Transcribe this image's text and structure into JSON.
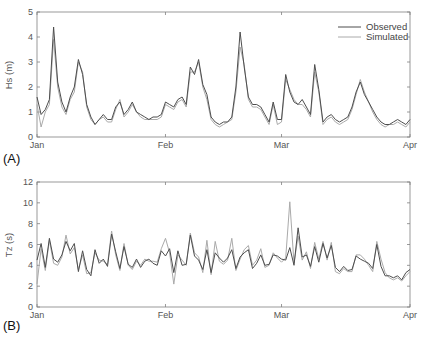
{
  "chart_data": [
    {
      "id": "A",
      "type": "line",
      "panel_label": "(A)",
      "title": "",
      "xlabel": "",
      "ylabel": "Hs (m)",
      "ylim": [
        0,
        5
      ],
      "yticks": [
        0,
        1,
        2,
        3,
        4,
        5
      ],
      "xticks": [
        "Jan",
        "Feb",
        "Mar",
        "Apr"
      ],
      "xtick_days": [
        0,
        31,
        59,
        90
      ],
      "xlim_days": [
        0,
        90
      ],
      "grid": false,
      "legend": {
        "position": "upper right",
        "entries": [
          "Observed",
          "Simulated"
        ]
      },
      "x_days": [
        0,
        1,
        2,
        3,
        4,
        5,
        6,
        7,
        8,
        9,
        10,
        11,
        12,
        13,
        14,
        15,
        16,
        17,
        18,
        19,
        20,
        21,
        22,
        23,
        24,
        25,
        26,
        27,
        28,
        29,
        30,
        31,
        32,
        33,
        34,
        35,
        36,
        37,
        38,
        39,
        40,
        41,
        42,
        43,
        44,
        45,
        46,
        47,
        48,
        49,
        50,
        51,
        52,
        53,
        54,
        55,
        56,
        57,
        58,
        59,
        60,
        61,
        62,
        63,
        64,
        65,
        66,
        67,
        68,
        69,
        70,
        71,
        72,
        73,
        74,
        75,
        76,
        77,
        78,
        79,
        80,
        81,
        82,
        83,
        84,
        85,
        86,
        87,
        88,
        89,
        90
      ],
      "series": [
        {
          "name": "Observed",
          "color": "#4d4d4d",
          "values": [
            1.6,
            0.9,
            1.1,
            1.5,
            4.4,
            2.2,
            1.4,
            1.0,
            1.6,
            2.0,
            3.1,
            2.5,
            1.3,
            0.8,
            0.5,
            0.7,
            0.9,
            0.7,
            0.7,
            1.2,
            1.4,
            0.9,
            1.1,
            1.4,
            1.0,
            0.9,
            0.8,
            0.7,
            0.8,
            0.8,
            0.9,
            1.4,
            1.3,
            1.2,
            1.5,
            1.6,
            1.3,
            2.8,
            2.5,
            3.1,
            2.1,
            1.7,
            0.8,
            0.6,
            0.5,
            0.6,
            0.6,
            0.8,
            2.0,
            4.2,
            2.8,
            1.6,
            1.3,
            1.3,
            1.2,
            0.9,
            0.6,
            1.4,
            0.7,
            0.7,
            2.5,
            1.8,
            1.4,
            1.3,
            1.5,
            1.2,
            0.9,
            2.9,
            1.9,
            0.6,
            0.8,
            0.9,
            0.7,
            0.6,
            0.7,
            0.8,
            1.2,
            1.8,
            2.2,
            1.7,
            1.4,
            1.1,
            0.8,
            0.6,
            0.5,
            0.5,
            0.6,
            0.7,
            0.6,
            0.5,
            0.7
          ]
        },
        {
          "name": "Simulated",
          "color": "#aaaaaa",
          "values": [
            1.3,
            0.4,
            1.0,
            1.3,
            3.9,
            2.0,
            1.2,
            0.9,
            1.5,
            1.8,
            3.0,
            2.6,
            1.2,
            0.7,
            0.5,
            0.7,
            0.8,
            0.6,
            0.6,
            1.1,
            1.5,
            0.8,
            1.0,
            1.3,
            1.0,
            0.8,
            0.7,
            0.7,
            0.7,
            0.7,
            0.8,
            1.3,
            1.2,
            1.1,
            1.4,
            1.5,
            1.2,
            2.6,
            2.6,
            3.0,
            2.0,
            1.5,
            0.7,
            0.5,
            0.4,
            0.5,
            0.6,
            0.7,
            1.8,
            3.6,
            2.9,
            1.5,
            1.2,
            1.2,
            1.1,
            0.8,
            0.5,
            1.3,
            0.5,
            0.6,
            2.3,
            1.9,
            1.5,
            1.3,
            1.3,
            1.1,
            0.8,
            2.6,
            1.8,
            0.5,
            0.7,
            0.8,
            0.6,
            0.5,
            0.6,
            0.7,
            1.1,
            1.7,
            2.3,
            1.8,
            1.4,
            1.0,
            0.7,
            0.5,
            0.4,
            0.5,
            0.5,
            0.6,
            0.5,
            0.4,
            0.6
          ]
        }
      ]
    },
    {
      "id": "B",
      "type": "line",
      "panel_label": "(B)",
      "title": "",
      "xlabel": "",
      "ylabel": "Tz (s)",
      "ylim": [
        0,
        12
      ],
      "yticks": [
        0,
        2,
        4,
        6,
        8,
        10,
        12
      ],
      "xticks": [
        "Jan",
        "Feb",
        "Mar",
        "Apr"
      ],
      "xtick_days": [
        0,
        31,
        59,
        90
      ],
      "xlim_days": [
        0,
        90
      ],
      "grid": false,
      "legend": null,
      "x_days": [
        0,
        1,
        2,
        3,
        4,
        5,
        6,
        7,
        8,
        9,
        10,
        11,
        12,
        13,
        14,
        15,
        16,
        17,
        18,
        19,
        20,
        21,
        22,
        23,
        24,
        25,
        26,
        27,
        28,
        29,
        30,
        31,
        32,
        33,
        34,
        35,
        36,
        37,
        38,
        39,
        40,
        41,
        42,
        43,
        44,
        45,
        46,
        47,
        48,
        49,
        50,
        51,
        52,
        53,
        54,
        55,
        56,
        57,
        58,
        59,
        60,
        61,
        62,
        63,
        64,
        65,
        66,
        67,
        68,
        69,
        70,
        71,
        72,
        73,
        74,
        75,
        76,
        77,
        78,
        79,
        80,
        81,
        82,
        83,
        84,
        85,
        86,
        87,
        88,
        89,
        90
      ],
      "series": [
        {
          "name": "Observed",
          "color": "#4d4d4d",
          "values": [
            4.5,
            6.1,
            3.8,
            6.6,
            4.6,
            4.3,
            5.0,
            6.3,
            5.4,
            6.1,
            3.4,
            5.4,
            3.6,
            3.0,
            5.5,
            4.2,
            4.6,
            3.9,
            7.0,
            5.3,
            3.7,
            5.8,
            4.1,
            3.8,
            4.6,
            3.8,
            4.4,
            4.6,
            4.2,
            4.0,
            5.4,
            4.9,
            5.6,
            3.3,
            5.4,
            4.0,
            4.1,
            6.9,
            4.9,
            4.5,
            3.6,
            5.5,
            3.3,
            5.2,
            4.7,
            4.3,
            4.7,
            5.5,
            3.7,
            4.8,
            5.2,
            5.5,
            3.7,
            4.2,
            5.0,
            4.0,
            4.1,
            5.0,
            4.9,
            4.6,
            4.5,
            5.7,
            4.0,
            7.6,
            4.8,
            5.0,
            3.9,
            5.8,
            4.3,
            6.1,
            4.7,
            5.9,
            3.8,
            3.4,
            3.9,
            3.5,
            3.6,
            4.9,
            4.6,
            4.4,
            4.2,
            3.7,
            6.0,
            3.9,
            3.0,
            3.0,
            2.8,
            3.0,
            2.6,
            3.3,
            3.6
          ]
        },
        {
          "name": "Simulated",
          "color": "#aaaaaa",
          "values": [
            2.2,
            5.6,
            3.5,
            6.4,
            4.2,
            4.0,
            4.8,
            6.9,
            5.1,
            5.7,
            3.6,
            5.0,
            3.2,
            3.3,
            5.2,
            4.5,
            4.4,
            4.1,
            7.3,
            5.0,
            3.5,
            6.1,
            4.0,
            3.6,
            4.4,
            4.0,
            4.6,
            4.4,
            4.4,
            4.3,
            5.6,
            6.6,
            5.2,
            2.2,
            5.0,
            4.5,
            4.0,
            7.1,
            5.2,
            4.8,
            3.3,
            6.4,
            3.1,
            6.3,
            4.4,
            4.1,
            4.5,
            6.6,
            3.5,
            4.6,
            5.5,
            5.9,
            4.0,
            4.5,
            5.6,
            3.8,
            4.0,
            5.2,
            4.7,
            4.3,
            4.7,
            10.1,
            4.2,
            6.8,
            4.5,
            5.3,
            3.7,
            6.2,
            4.6,
            6.3,
            4.5,
            6.2,
            3.4,
            3.2,
            3.7,
            3.4,
            3.4,
            5.0,
            5.0,
            4.6,
            4.0,
            3.4,
            6.3,
            4.6,
            3.3,
            2.8,
            2.6,
            2.8,
            2.5,
            3.0,
            3.4
          ]
        }
      ]
    }
  ],
  "panels": {
    "a": {
      "tag": "(A)",
      "ylabel": "Hs (m)",
      "legend": {
        "observed": "Observed",
        "simulated": "Simulated"
      }
    },
    "b": {
      "tag": "(B)",
      "ylabel": "Tz (s)"
    }
  },
  "colors": {
    "observed": "#4d4d4d",
    "simulated": "#aaaaaa",
    "axis": "#808080"
  }
}
